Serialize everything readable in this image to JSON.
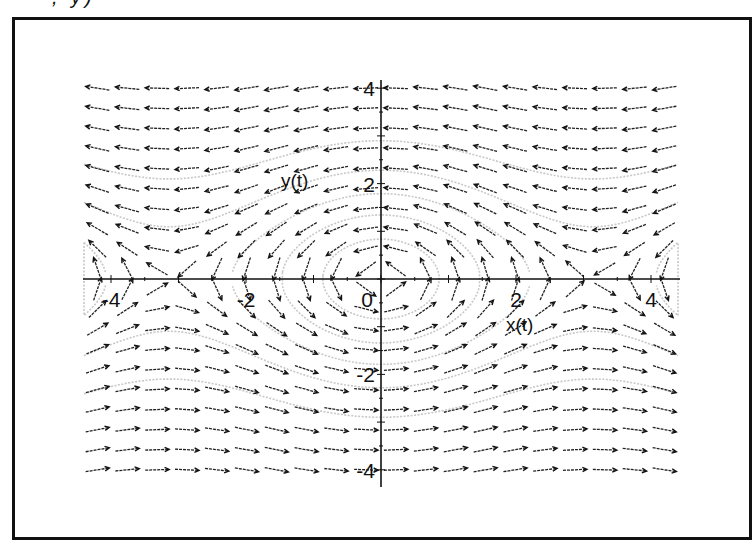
{
  "header": {
    "cropped_fragment": ", y)"
  },
  "chart_data": {
    "type": "direction_field",
    "title": "",
    "system": {
      "dx_dt": "-y(t)",
      "dy_dt": "sin(x(t))"
    },
    "xlabel": "x(t)",
    "ylabel": "y(t)",
    "xlim": [
      -4.4,
      4.4
    ],
    "ylim": [
      -4.35,
      4.2
    ],
    "x_ticks": [
      -4,
      -2,
      0,
      2,
      4
    ],
    "y_ticks": [
      -4,
      -2,
      2,
      4
    ],
    "x_tick_labels": [
      "-4",
      "-2",
      "0",
      "2",
      "4"
    ],
    "y_tick_labels": [
      "-4",
      "-2",
      "2",
      "4"
    ],
    "grid": false,
    "legend": null,
    "dirgrid": {
      "nx": 20,
      "ny": 20,
      "x_range": [
        -4.2,
        4.2
      ],
      "y_range": [
        -4.0,
        4.0
      ]
    },
    "arrow_style": "slim, normalized length",
    "arrow_color": "#222222",
    "trajectory_color": "#c8c8c8",
    "trajectories": [
      {
        "type": "closed_orbit",
        "energy": 0.35
      },
      {
        "type": "closed_orbit",
        "energy": 0.9
      },
      {
        "type": "closed_orbit",
        "energy": 1.6
      },
      {
        "type": "open_orbit",
        "energy": 2.6
      },
      {
        "type": "open_orbit",
        "energy": 4.2
      }
    ]
  },
  "layout": {
    "origin_px": [
      381,
      279
    ],
    "px_per_unit_x": 67.5,
    "px_per_unit_y": 47.7,
    "x_axis_px": [
      83,
      680
    ],
    "y_axis_px": [
      80,
      487
    ],
    "arrow_len_px": 24,
    "x_label_pos_px": [
      506,
      331
    ],
    "y_label_pos_px": [
      281,
      187
    ]
  }
}
